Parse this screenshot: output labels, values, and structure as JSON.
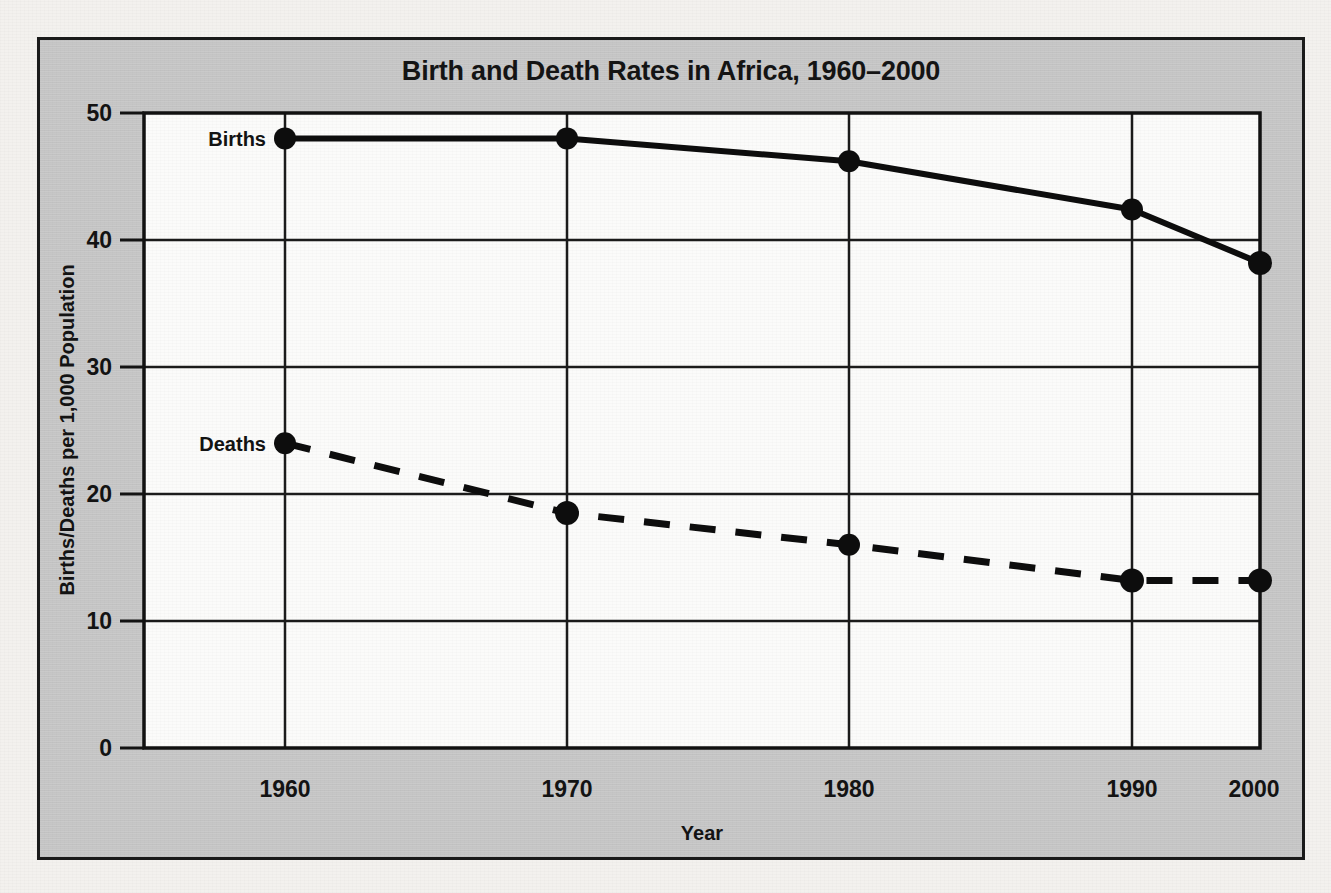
{
  "chart_data": {
    "type": "line",
    "title": "Birth and Death Rates in Africa, 1960–2000",
    "xlabel": "Year",
    "ylabel": "Births/Deaths per 1,000 Population",
    "x": [
      1960,
      1970,
      1980,
      1990,
      2000
    ],
    "xtick_labels": [
      "1960",
      "1970",
      "1980",
      "1990",
      "2000"
    ],
    "ytick_labels": [
      "0",
      "10",
      "20",
      "30",
      "40",
      "50"
    ],
    "yticks": [
      0,
      10,
      20,
      30,
      40,
      50
    ],
    "ylim": [
      0,
      50
    ],
    "xlim": [
      1960,
      2000
    ],
    "grid": "both",
    "legend_position": "inline-left-labels",
    "series": [
      {
        "name": "Births",
        "label": "Births",
        "style": "solid",
        "color": "#000000",
        "values": [
          48.0,
          48.0,
          46.2,
          42.4,
          38.2
        ]
      },
      {
        "name": "Deaths",
        "label": "Deaths",
        "style": "dashed",
        "color": "#000000",
        "values": [
          24.0,
          18.5,
          16.0,
          13.2,
          13.2
        ]
      }
    ]
  },
  "panel": {
    "background_color": "#c9c9c9",
    "plot_background_color": "#fbfbfa",
    "border_color": "#1a1a1a"
  },
  "page": {
    "background_color": "#f3f1ee"
  }
}
